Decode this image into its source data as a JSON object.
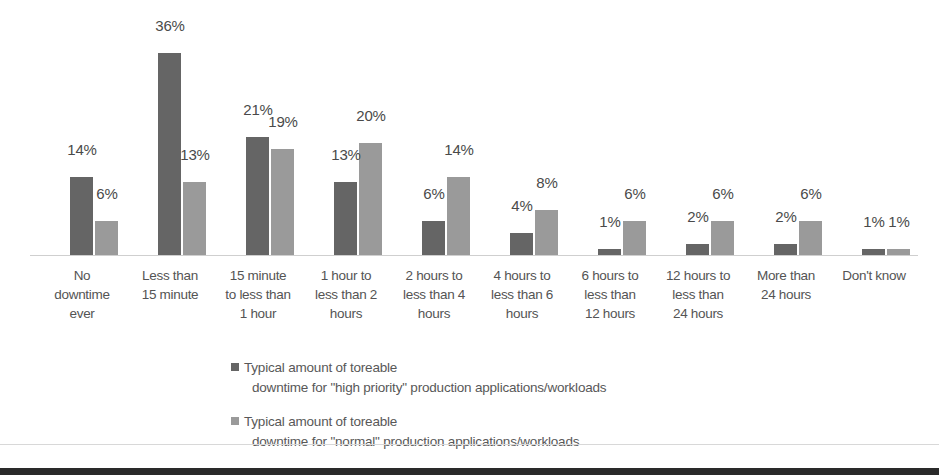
{
  "chart_data": {
    "type": "bar",
    "title": "",
    "subtitle": "",
    "xlabel": "",
    "ylabel": "",
    "ylim": [
      0,
      40
    ],
    "grid": false,
    "legend_position": "bottom",
    "categories": [
      "No downtime ever",
      "Less than 15 minute",
      "15 minute to less than 1 hour",
      "1 hour to less than 2 hours",
      "2 hours to less than 4 hours",
      "4 hours to less than 6 hours",
      "6 hours to less than 12 hours",
      "12 hours to less than 24 hours",
      "More than 24 hours",
      "Don't know"
    ],
    "category_lines": [
      [
        "No",
        "downtime",
        "ever"
      ],
      [
        "Less than",
        "15 minute",
        ""
      ],
      [
        "15 minute",
        "to less than",
        "1 hour"
      ],
      [
        "1 hour to",
        "less than 2",
        "hours"
      ],
      [
        "2 hours to",
        "less than 4",
        "hours"
      ],
      [
        "4 hours to",
        "less than 6",
        "hours"
      ],
      [
        "6 hours to",
        "less than",
        "12 hours"
      ],
      [
        "12 hours to",
        "less than",
        "24 hours"
      ],
      [
        "More than",
        "24 hours",
        ""
      ],
      [
        "Don't know",
        "",
        ""
      ]
    ],
    "series": [
      {
        "name": "Typical amount of toreable downtime for \"high priority\" production applications/workloads",
        "name_line1": "Typical amount of toreable",
        "name_line2": "downtime for \"high priority\" production applications/workloads",
        "color": "#656565",
        "values": [
          14,
          36,
          21,
          13,
          6,
          4,
          1,
          2,
          2,
          1
        ],
        "labels": [
          "14%",
          "36%",
          "21%",
          "13%",
          "6%",
          "4%",
          "1%",
          "2%",
          "2%",
          "1%"
        ]
      },
      {
        "name": "Typical amount of toreable downtime for \"normal\" production applications/workloads",
        "name_line1": "Typical amount of toreable",
        "name_line2": "downtime for \"normal\" production applications/workloads",
        "color": "#9a9a9a",
        "values": [
          6,
          13,
          19,
          20,
          14,
          8,
          6,
          6,
          6,
          1
        ],
        "labels": [
          "6%",
          "13%",
          "19%",
          "20%",
          "14%",
          "8%",
          "6%",
          "6%",
          "6%",
          "1%"
        ]
      }
    ]
  }
}
